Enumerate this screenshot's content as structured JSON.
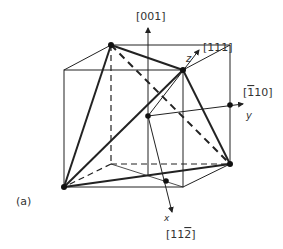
{
  "figure": {
    "panel_label": "(a)",
    "axes": {
      "vertical": {
        "label": "[001]"
      },
      "z": {
        "letter": "z",
        "label": "[111]"
      },
      "y": {
        "letter": "y",
        "label_prefix": "[",
        "label_bar": "1",
        "label_rest": "10]"
      },
      "x": {
        "letter": "x",
        "label_prefix": "[11",
        "label_bar": "2",
        "label_rest": "]"
      }
    },
    "colors": {
      "line": "#222222",
      "text": "#333333",
      "background": "#ffffff"
    }
  }
}
